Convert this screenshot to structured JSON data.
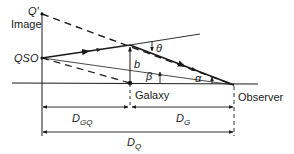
{
  "diagram": {
    "labels": {
      "image_point": "Q'",
      "image": "Image",
      "qso": "QSO",
      "galaxy": "Galaxy",
      "observer": "Observer",
      "impact_parameter": "b",
      "theta": "θ",
      "beta": "β",
      "alpha": "α",
      "d_gq_main": "D",
      "d_gq_sub": "GQ",
      "d_g_main": "D",
      "d_g_sub": "G",
      "d_q_main": "D",
      "d_q_sub": "Q"
    },
    "nodes": {
      "q_prime": [
        42,
        14
      ],
      "qso": [
        42,
        58
      ],
      "bend": [
        130,
        45
      ],
      "galaxy": [
        130,
        83
      ],
      "observer": [
        234,
        85
      ]
    },
    "colors": {
      "line": "#1a1a1a",
      "background": "#ffffff"
    }
  }
}
